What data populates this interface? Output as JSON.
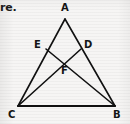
{
  "page": {
    "width": 130,
    "height": 124,
    "background_color": "#f6f5f4",
    "ink_color": "#111111",
    "caption_fragment": "re."
  },
  "figure": {
    "name": "triangle-with-cevians",
    "stroke_color": "#111111",
    "stroke_width": 1.6,
    "labels": {
      "a": "A",
      "b": "B",
      "c": "C",
      "d": "D",
      "e": "E",
      "f": "F"
    },
    "points": {
      "A": {
        "x": 65,
        "y": 19
      },
      "B": {
        "x": 115,
        "y": 106
      },
      "C": {
        "x": 18,
        "y": 106
      },
      "D": {
        "x": 81,
        "y": 49
      },
      "E": {
        "x": 46,
        "y": 49
      },
      "F": {
        "x": 64,
        "y": 62
      }
    },
    "label_positions": {
      "A": {
        "x": 61,
        "y": 3
      },
      "B": {
        "x": 113,
        "y": 110
      },
      "C": {
        "x": 8,
        "y": 110
      },
      "D": {
        "x": 84,
        "y": 40
      },
      "E": {
        "x": 34,
        "y": 40
      },
      "F": {
        "x": 61,
        "y": 66
      }
    },
    "segments": [
      {
        "name": "side-AC",
        "from": "A",
        "to": "C"
      },
      {
        "name": "side-AB",
        "from": "A",
        "to": "B"
      },
      {
        "name": "base-CB",
        "from": "C",
        "to": "B"
      },
      {
        "name": "cevian-CD",
        "from": "C",
        "to": "D"
      },
      {
        "name": "cevian-BE",
        "from": "B",
        "to": "E"
      }
    ]
  }
}
